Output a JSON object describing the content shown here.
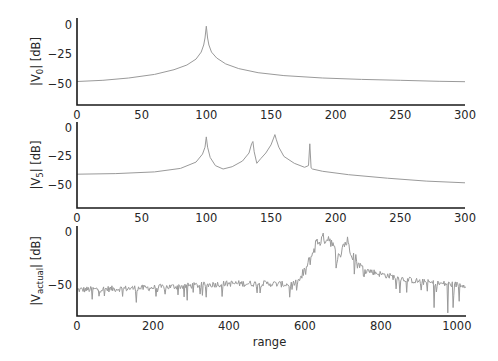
{
  "figure": {
    "width": 498,
    "height": 361,
    "line_color": "#9a9a9a",
    "axis_color": "#1a1a1a",
    "text_color": "#262626"
  },
  "chart_data": [
    {
      "type": "line",
      "title": "",
      "ylabel": "|V0| [dB]",
      "ylabel_main": "|V",
      "ylabel_sub": "0",
      "ylabel_tail": "| [dB]",
      "xlabel": "",
      "xlim": [
        0,
        300
      ],
      "ylim": [
        -68,
        6
      ],
      "xticks": [
        0,
        50,
        100,
        150,
        200,
        250,
        300
      ],
      "xtick_labels": [
        "0",
        "50",
        "100",
        "150",
        "200",
        "250",
        "300"
      ],
      "yticks": [
        0,
        -25,
        -50
      ],
      "ytick_labels": [
        "0",
        "−25",
        "−50"
      ],
      "grid": false,
      "box": {
        "left": 77,
        "top": 18,
        "right": 465,
        "bottom": 105
      },
      "series": [
        {
          "name": "V0",
          "x": [
            0,
            20,
            40,
            60,
            75,
            85,
            92,
            96,
            98,
            99,
            100,
            101,
            102,
            104,
            108,
            115,
            125,
            140,
            160,
            190,
            220,
            250,
            280,
            300
          ],
          "y": [
            -48,
            -47,
            -45,
            -42,
            -38,
            -34,
            -29,
            -23,
            -17,
            -11,
            -1,
            -11,
            -17,
            -23,
            -28,
            -33,
            -37,
            -40.5,
            -43,
            -45,
            -46.2,
            -47,
            -47.8,
            -48.2
          ]
        }
      ]
    },
    {
      "type": "line",
      "title": "",
      "ylabel": "|V5| [dB]",
      "ylabel_main": "|V",
      "ylabel_sub": "5",
      "ylabel_tail": "| [dB]",
      "xlabel": "",
      "xlim": [
        0,
        300
      ],
      "ylim": [
        -70,
        5
      ],
      "xticks": [
        0,
        50,
        100,
        150,
        200,
        250,
        300
      ],
      "xtick_labels": [
        "0",
        "50",
        "100",
        "150",
        "200",
        "250",
        "300"
      ],
      "yticks": [
        0,
        -25,
        -50
      ],
      "ytick_labels": [
        "0",
        "−25",
        "−50"
      ],
      "grid": false,
      "box": {
        "left": 77,
        "top": 122,
        "right": 465,
        "bottom": 208
      },
      "series": [
        {
          "name": "V5",
          "x": [
            0,
            30,
            60,
            80,
            92,
            97,
            99,
            100,
            101,
            103,
            107,
            113,
            120,
            128,
            133,
            135,
            136,
            137,
            139,
            142,
            146,
            150,
            152,
            153,
            154,
            156,
            160,
            168,
            176,
            179,
            180,
            181,
            182,
            190,
            210,
            240,
            270,
            300
          ],
          "y": [
            -40.5,
            -40,
            -38.5,
            -35.5,
            -30,
            -23,
            -17,
            -8,
            -17,
            -26,
            -33,
            -36,
            -34,
            -29,
            -22,
            -14,
            -12,
            -21,
            -31,
            -27,
            -22,
            -15,
            -9,
            -6,
            -10,
            -17,
            -25,
            -31,
            -34.5,
            -33,
            -14,
            -35,
            -36,
            -38,
            -41,
            -44,
            -46.5,
            -48
          ]
        }
      ]
    },
    {
      "type": "line",
      "title": "",
      "ylabel": "|Vactual| [dB]",
      "ylabel_main": "|V",
      "ylabel_sub": "actual",
      "ylabel_tail": "| [dB]",
      "xlabel": "range",
      "xlim": [
        0,
        1024
      ],
      "ylim": [
        -80,
        6
      ],
      "xticks": [
        0,
        200,
        400,
        600,
        800,
        1000
      ],
      "xtick_labels": [
        "0",
        "200",
        "400",
        "600",
        "800",
        "1000"
      ],
      "yticks": [
        0,
        -50
      ],
      "ytick_labels": [
        "0",
        "−50"
      ],
      "grid": false,
      "box": {
        "left": 77,
        "top": 226,
        "right": 466,
        "bottom": 316
      },
      "series": [
        {
          "name": "Vactual",
          "noisy": true,
          "envelope_x": [
            0,
            100,
            200,
            300,
            400,
            500,
            560,
            580,
            600,
            615,
            630,
            650,
            665,
            680,
            690,
            700,
            712,
            725,
            740,
            760,
            800,
            850,
            900,
            950,
            1000,
            1024
          ],
          "envelope_y": [
            -55,
            -54,
            -53,
            -51,
            -49,
            -49,
            -50,
            -48,
            -38,
            -25,
            -10,
            -6,
            -5,
            -20,
            -25,
            -12,
            -9,
            -20,
            -30,
            -36,
            -40,
            -44,
            -47,
            -49,
            -50,
            -50
          ],
          "spikes": [
            {
              "x": 40,
              "y": -64
            },
            {
              "x": 155,
              "y": -67
            },
            {
              "x": 290,
              "y": -65
            },
            {
              "x": 560,
              "y": -62
            },
            {
              "x": 730,
              "y": -40
            },
            {
              "x": 850,
              "y": -58
            },
            {
              "x": 940,
              "y": -72
            },
            {
              "x": 975,
              "y": -77
            },
            {
              "x": 990,
              "y": -72
            },
            {
              "x": 1005,
              "y": -66
            }
          ]
        }
      ]
    }
  ]
}
